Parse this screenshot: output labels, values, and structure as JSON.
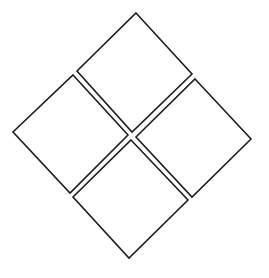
{
  "diagram": {
    "background": "#ffffff",
    "stroke_color": "#1e1e1e",
    "squares": [
      {
        "name": "top",
        "points": "136,13 192,74 132,132 77,71"
      },
      {
        "name": "left",
        "points": "73,75 128,135 70,193 13,132"
      },
      {
        "name": "right",
        "points": "195,79 251,139 192,197 136,137"
      },
      {
        "name": "bottom",
        "points": "131,140 188,200 129,258 73,197"
      }
    ]
  }
}
